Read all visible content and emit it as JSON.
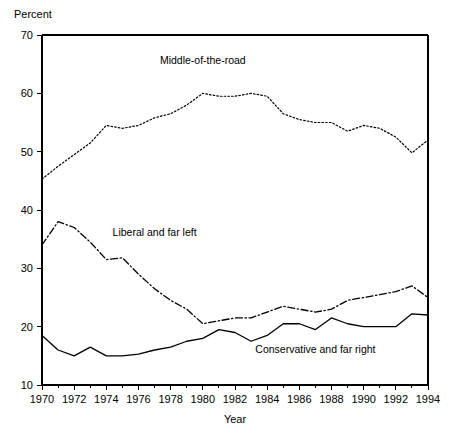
{
  "chart_data": {
    "type": "line",
    "title": "",
    "xlabel": "Year",
    "ylabel": "Percent",
    "xlim": [
      1970,
      1994
    ],
    "ylim": [
      10,
      70
    ],
    "grid": false,
    "legend_position": "inline-annotations",
    "x": [
      1970,
      1971,
      1972,
      1973,
      1974,
      1975,
      1976,
      1977,
      1978,
      1979,
      1980,
      1981,
      1982,
      1983,
      1984,
      1985,
      1986,
      1987,
      1988,
      1989,
      1990,
      1991,
      1992,
      1993,
      1994
    ],
    "y_ticks": [
      10,
      20,
      30,
      40,
      50,
      60,
      70
    ],
    "x_ticks_major": [
      1970,
      1972,
      1974,
      1976,
      1978,
      1980,
      1982,
      1984,
      1986,
      1988,
      1990,
      1992,
      1994
    ],
    "x_ticks_minor": [
      1971,
      1973,
      1975,
      1977,
      1979,
      1981,
      1983,
      1985,
      1987,
      1989,
      1991,
      1993
    ],
    "series": [
      {
        "name": "Middle-of-the-road",
        "style": "dotted",
        "color": "#000000",
        "label_x": 1980,
        "label_y": 65.0,
        "values": [
          45.3,
          47.5,
          49.5,
          51.5,
          54.5,
          54.0,
          54.5,
          55.8,
          56.5,
          58.0,
          60.0,
          59.5,
          59.5,
          60.0,
          59.5,
          56.5,
          55.5,
          55.0,
          55.0,
          53.5,
          54.5,
          54.0,
          52.5,
          49.8,
          52.0
        ]
      },
      {
        "name": "Liberal and far left",
        "style": "dashdot",
        "color": "#000000",
        "label_x": 1977,
        "label_y": 35.5,
        "values": [
          34.0,
          38.0,
          37.0,
          34.5,
          31.5,
          31.8,
          29.0,
          26.5,
          24.5,
          23.0,
          20.5,
          21.0,
          21.5,
          21.5,
          22.5,
          23.5,
          23.0,
          22.5,
          23.0,
          24.5,
          25.0,
          25.5,
          26.0,
          27.0,
          25.0
        ]
      },
      {
        "name": "Conservative and far right",
        "style": "solid",
        "color": "#000000",
        "label_x": 1987,
        "label_y": 15.5,
        "values": [
          18.5,
          16.0,
          15.0,
          16.5,
          15.0,
          15.0,
          15.3,
          16.0,
          16.5,
          17.5,
          18.0,
          19.5,
          19.0,
          17.5,
          18.5,
          20.5,
          20.5,
          19.5,
          21.5,
          20.5,
          20.0,
          20.0,
          20.0,
          22.2,
          22.0
        ]
      }
    ]
  }
}
